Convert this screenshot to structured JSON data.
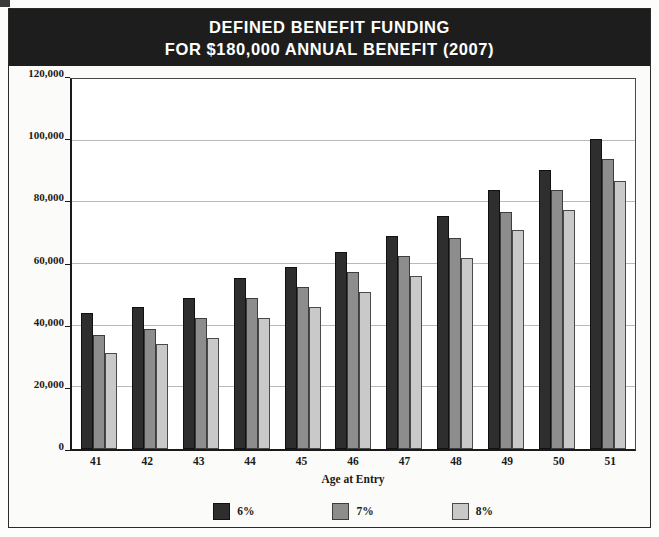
{
  "title": {
    "line1": "DEFINED BENEFIT FUNDING",
    "line2": "FOR $180,000 ANNUAL BENEFIT (2007)"
  },
  "colors": {
    "banner_background": "#1d1d1d",
    "banner_text": "#ffffff",
    "series_6pct": "#2e2e2e",
    "series_7pct": "#8d8d8d",
    "series_8pct": "#c9c9c9",
    "gridline": "#b9b9b9",
    "axis": "#1a1a1a",
    "plot_background": "#ffffff",
    "page_background": "#fbfbf9"
  },
  "chart_data": {
    "type": "bar",
    "title": "DEFINED BENEFIT FUNDING FOR $180,000 ANNUAL BENEFIT (2007)",
    "xlabel": "Age at Entry",
    "ylabel": "",
    "categories": [
      "41",
      "42",
      "43",
      "44",
      "45",
      "46",
      "47",
      "48",
      "49",
      "50",
      "51"
    ],
    "series": [
      {
        "name": "6%",
        "color": "#2e2e2e",
        "values": [
          44000,
          46000,
          49000,
          55500,
          59000,
          64000,
          69000,
          75500,
          84000,
          90500,
          100500
        ]
      },
      {
        "name": "7%",
        "color": "#8d8d8d",
        "values": [
          37000,
          39000,
          42500,
          49000,
          52500,
          57500,
          62500,
          68500,
          77000,
          84000,
          94000
        ]
      },
      {
        "name": "8%",
        "color": "#c9c9c9",
        "values": [
          31000,
          34000,
          36000,
          42500,
          46000,
          51000,
          56000,
          62000,
          71000,
          77500,
          87000
        ]
      }
    ],
    "ylim": [
      0,
      120000
    ],
    "ytick_values": [
      0,
      20000,
      40000,
      60000,
      80000,
      100000,
      120000
    ],
    "ytick_labels": [
      "0",
      "20,000",
      "40,000",
      "60,000",
      "80,000",
      "100,000",
      "120,000"
    ],
    "grid": true,
    "legend_position": "bottom-center",
    "legend_entries": [
      "6%",
      "7%",
      "8%"
    ]
  }
}
